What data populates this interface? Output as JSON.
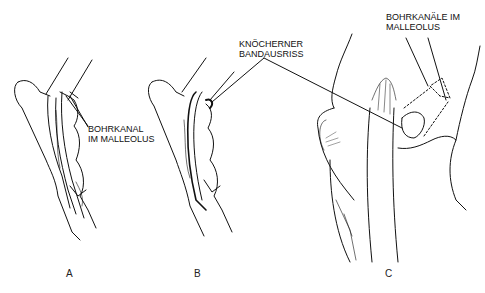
{
  "figure": {
    "panels": [
      {
        "id": "A",
        "letter": "A",
        "annotation": {
          "line1": "BOHRKANAL",
          "line2": "IM MALLEOLUS"
        }
      },
      {
        "id": "B",
        "letter": "B"
      },
      {
        "id": "C",
        "letter": "C",
        "annotation": {
          "line1": "BOHRKANÄLE IM",
          "line2": "MALLEOLUS"
        }
      }
    ],
    "shared_annotation": {
      "line1": "KNÖCHERNER",
      "line2": "BANDAUSRISS"
    }
  }
}
